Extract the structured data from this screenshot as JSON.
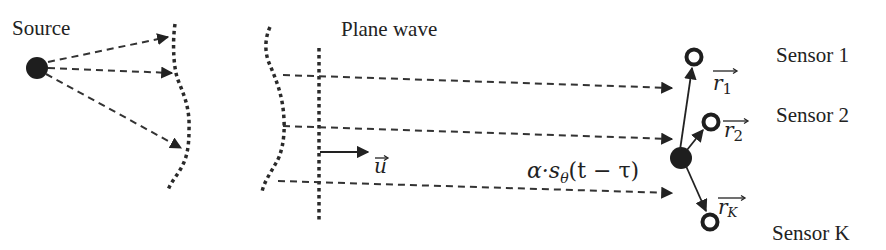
{
  "diagram": {
    "labels": {
      "source": "Source",
      "plane_wave": "Plane wave",
      "sensor_1": "Sensor 1",
      "sensor_2": "Sensor 2",
      "sensor_k": "Sensor K"
    },
    "math": {
      "direction_vector": "u",
      "signal_expression": "α·sθ(t − τ)",
      "signal_alpha": "α·s",
      "signal_sub": "θ",
      "signal_args": "(t − τ)",
      "r1_base": "r",
      "r1_sub": "1",
      "r2_base": "r",
      "r2_sub": "2",
      "rk_base": "r",
      "rk_sub": "K"
    },
    "colors": {
      "ink": "#222222",
      "background": "#ffffff"
    }
  }
}
